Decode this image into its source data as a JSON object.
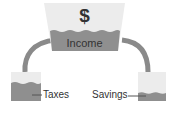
{
  "diagram": {
    "source": {
      "symbol": "$",
      "label": "Income"
    },
    "targets": [
      {
        "label": "Taxes",
        "level": "high"
      },
      {
        "label": "Savings",
        "level": "low"
      }
    ],
    "colors": {
      "water": "#8f8f8f",
      "container_bg": "#ebebeb",
      "pipe": "#8a8a8a",
      "text": "#333333"
    }
  }
}
